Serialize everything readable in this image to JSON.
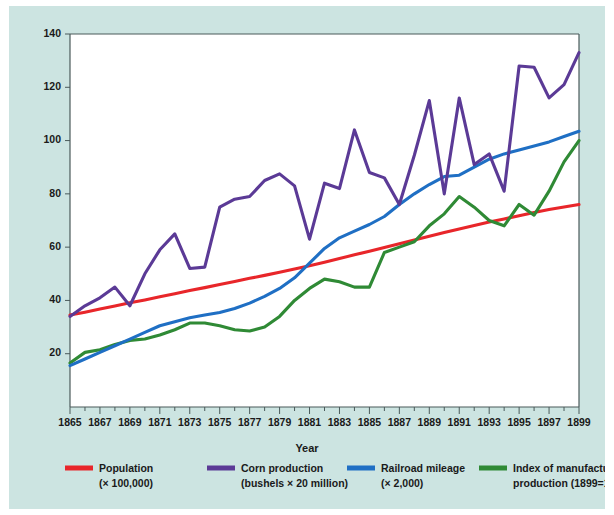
{
  "figure": {
    "background_color": "#cce4e1",
    "plot_background_color": "#ffffff",
    "axis_color": "#4a5a5a"
  },
  "chart_data": {
    "type": "line",
    "title": "",
    "xlabel": "Year",
    "ylabel": "",
    "xlim": [
      1865,
      1899
    ],
    "ylim": [
      0,
      140
    ],
    "grid": false,
    "legend_position": "bottom",
    "x_major_ticks": [
      1865,
      1867,
      1869,
      1871,
      1873,
      1875,
      1877,
      1879,
      1881,
      1883,
      1885,
      1887,
      1889,
      1891,
      1893,
      1895,
      1897,
      1899
    ],
    "x_minor_ticks": [
      1866,
      1868,
      1870,
      1872,
      1874,
      1876,
      1878,
      1880,
      1882,
      1884,
      1886,
      1888,
      1890,
      1892,
      1894,
      1896,
      1898
    ],
    "y_ticks": [
      20,
      40,
      60,
      80,
      100,
      120,
      140
    ],
    "x": [
      1865,
      1866,
      1867,
      1868,
      1869,
      1870,
      1871,
      1872,
      1873,
      1874,
      1875,
      1876,
      1877,
      1878,
      1879,
      1880,
      1881,
      1882,
      1883,
      1884,
      1885,
      1886,
      1887,
      1888,
      1889,
      1890,
      1891,
      1892,
      1893,
      1894,
      1895,
      1896,
      1897,
      1898,
      1899
    ],
    "series": [
      {
        "name": "Population",
        "unit_note": "(× 100,000)",
        "color": "#e8262a",
        "values": [
          34.5,
          35.6,
          36.8,
          37.9,
          39.1,
          40.2,
          41.4,
          42.5,
          43.7,
          44.8,
          46.0,
          47.1,
          48.3,
          49.4,
          50.6,
          51.8,
          53.0,
          54.3,
          55.7,
          57.1,
          58.5,
          59.9,
          61.3,
          62.7,
          64.1,
          65.5,
          66.8,
          68.1,
          69.4,
          70.6,
          71.8,
          73.0,
          74.1,
          75.1,
          76.0
        ]
      },
      {
        "name": "Corn production",
        "unit_note": "(bushels × 20 million)",
        "color": "#5b3a96",
        "values": [
          34.0,
          38.0,
          41.0,
          45.0,
          38.0,
          50.0,
          59.0,
          65.0,
          52.0,
          52.5,
          75.0,
          78.0,
          79.0,
          85.0,
          87.5,
          83.0,
          63.0,
          84.0,
          82.0,
          104.0,
          88.0,
          86.0,
          76.0,
          94.5,
          115.0,
          80.0,
          116.0,
          91.0,
          95.0,
          81.0,
          128.0,
          127.5,
          116.0,
          121.0,
          133.0
        ]
      },
      {
        "name": "Railroad mileage",
        "unit_note": "(× 2,000)",
        "color": "#1f6fc4",
        "values": [
          15.5,
          18.0,
          20.5,
          23.0,
          25.5,
          28.0,
          30.5,
          32.0,
          33.5,
          34.5,
          35.5,
          37.0,
          39.0,
          41.5,
          44.5,
          48.5,
          54.0,
          59.5,
          63.5,
          66.0,
          68.5,
          71.5,
          76.0,
          80.0,
          83.5,
          86.5,
          87.0,
          90.0,
          93.0,
          95.0,
          96.5,
          98.0,
          99.5,
          101.5,
          103.5
        ]
      },
      {
        "name": "Index of manufacturing production",
        "unit_note": "(1899=100)",
        "color": "#2f8a35",
        "values": [
          16.5,
          20.5,
          21.5,
          23.5,
          25.0,
          25.5,
          27.0,
          29.0,
          31.5,
          31.5,
          30.5,
          29.0,
          28.5,
          30.0,
          34.0,
          40.0,
          44.5,
          48.0,
          47.0,
          45.0,
          45.0,
          58.0,
          60.0,
          62.0,
          68.0,
          72.5,
          79.0,
          75.0,
          70.0,
          68.0,
          76.0,
          72.0,
          81.0,
          92.0,
          100.0
        ]
      }
    ],
    "legend": [
      {
        "label": "Population",
        "sub": "(× 100,000)",
        "color": "#e8262a"
      },
      {
        "label": "Corn production",
        "sub": "(bushels × 20 million)",
        "color": "#5b3a96"
      },
      {
        "label": "Railroad mileage",
        "sub": "(× 2,000)",
        "color": "#1f6fc4"
      },
      {
        "label": "Index of manufacturing",
        "sub": "production (1899=100)",
        "color": "#2f8a35"
      }
    ]
  }
}
